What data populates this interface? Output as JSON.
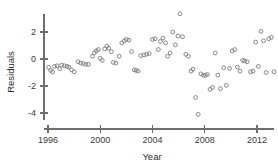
{
  "chart_data": {
    "type": "scatter",
    "title": "",
    "xlabel": "Year",
    "ylabel": "Residuals",
    "xlim": [
      1995.3,
      2013.6
    ],
    "ylim": [
      -4.8,
      3.6
    ],
    "xticks": [
      1996,
      2000,
      2004,
      2008,
      2012
    ],
    "xtick_labels": [
      "1996",
      "2000",
      "2004",
      "2008",
      "2012"
    ],
    "yticks": [
      2,
      0,
      -2,
      -4
    ],
    "ytick_labels": [
      "2",
      "0",
      "-2",
      "-4"
    ],
    "grid": false,
    "legend": null,
    "marker": "open-circle",
    "marker_color": "#7a7a7a",
    "axis_color": "#6e6e6e",
    "points": [
      {
        "x": 1996.05,
        "y": -0.62
      },
      {
        "x": 1996.2,
        "y": -0.85
      },
      {
        "x": 1996.35,
        "y": -0.95
      },
      {
        "x": 1996.5,
        "y": -0.55
      },
      {
        "x": 1996.7,
        "y": -0.5
      },
      {
        "x": 1996.9,
        "y": -0.72
      },
      {
        "x": 1997.05,
        "y": -0.45
      },
      {
        "x": 1997.25,
        "y": -0.5
      },
      {
        "x": 1997.45,
        "y": -0.55
      },
      {
        "x": 1997.6,
        "y": -0.6
      },
      {
        "x": 1997.8,
        "y": -0.8
      },
      {
        "x": 1998.0,
        "y": -0.95
      },
      {
        "x": 1998.3,
        "y": -0.2
      },
      {
        "x": 1998.5,
        "y": -0.3
      },
      {
        "x": 1998.7,
        "y": -0.35
      },
      {
        "x": 1998.9,
        "y": -0.4
      },
      {
        "x": 1999.1,
        "y": -0.4
      },
      {
        "x": 1999.4,
        "y": 0.2
      },
      {
        "x": 1999.55,
        "y": 0.45
      },
      {
        "x": 1999.7,
        "y": 0.6
      },
      {
        "x": 1999.85,
        "y": 0.7
      },
      {
        "x": 2000.0,
        "y": 0.05
      },
      {
        "x": 2000.15,
        "y": -0.1
      },
      {
        "x": 2000.35,
        "y": 0.75
      },
      {
        "x": 2000.5,
        "y": 0.95
      },
      {
        "x": 2000.65,
        "y": 0.8
      },
      {
        "x": 2000.85,
        "y": 0.55
      },
      {
        "x": 2001.0,
        "y": -0.25
      },
      {
        "x": 2001.2,
        "y": -0.3
      },
      {
        "x": 2001.45,
        "y": 0.2
      },
      {
        "x": 2001.65,
        "y": 1.2
      },
      {
        "x": 2001.85,
        "y": 1.35
      },
      {
        "x": 2002.0,
        "y": 1.45
      },
      {
        "x": 2002.2,
        "y": 1.4
      },
      {
        "x": 2002.4,
        "y": 0.55
      },
      {
        "x": 2002.6,
        "y": -0.8
      },
      {
        "x": 2002.75,
        "y": -0.85
      },
      {
        "x": 2002.9,
        "y": -0.9
      },
      {
        "x": 2003.1,
        "y": 0.25
      },
      {
        "x": 2003.35,
        "y": 0.3
      },
      {
        "x": 2003.55,
        "y": 0.35
      },
      {
        "x": 2003.75,
        "y": 0.4
      },
      {
        "x": 2004.0,
        "y": 1.45
      },
      {
        "x": 2004.2,
        "y": 1.5
      },
      {
        "x": 2004.45,
        "y": 0.7
      },
      {
        "x": 2004.6,
        "y": 1.3
      },
      {
        "x": 2004.8,
        "y": 1.55
      },
      {
        "x": 2005.0,
        "y": 1.2
      },
      {
        "x": 2005.15,
        "y": 0.2
      },
      {
        "x": 2005.35,
        "y": 0.45
      },
      {
        "x": 2005.55,
        "y": 2.0
      },
      {
        "x": 2005.75,
        "y": 1.05
      },
      {
        "x": 2005.95,
        "y": 1.7
      },
      {
        "x": 2006.1,
        "y": 3.35
      },
      {
        "x": 2006.3,
        "y": 1.65
      },
      {
        "x": 2006.55,
        "y": 0.35
      },
      {
        "x": 2006.75,
        "y": 0.2
      },
      {
        "x": 2006.95,
        "y": -0.9
      },
      {
        "x": 2007.1,
        "y": -0.75
      },
      {
        "x": 2007.3,
        "y": -2.85
      },
      {
        "x": 2007.5,
        "y": -4.1
      },
      {
        "x": 2007.7,
        "y": -1.1
      },
      {
        "x": 2007.9,
        "y": -1.2
      },
      {
        "x": 2008.05,
        "y": -1.2
      },
      {
        "x": 2008.2,
        "y": -1.15
      },
      {
        "x": 2008.4,
        "y": -2.25
      },
      {
        "x": 2008.6,
        "y": -2.1
      },
      {
        "x": 2008.8,
        "y": 0.45
      },
      {
        "x": 2009.0,
        "y": -1.2
      },
      {
        "x": 2009.2,
        "y": -2.2
      },
      {
        "x": 2009.45,
        "y": -0.65
      },
      {
        "x": 2009.65,
        "y": -1.95
      },
      {
        "x": 2009.9,
        "y": -0.7
      },
      {
        "x": 2010.1,
        "y": 0.6
      },
      {
        "x": 2010.3,
        "y": 0.7
      },
      {
        "x": 2010.5,
        "y": -0.6
      },
      {
        "x": 2010.7,
        "y": -0.9
      },
      {
        "x": 2010.9,
        "y": -0.1
      },
      {
        "x": 2011.05,
        "y": -0.15
      },
      {
        "x": 2011.25,
        "y": -0.2
      },
      {
        "x": 2011.5,
        "y": -0.95
      },
      {
        "x": 2011.7,
        "y": -0.9
      },
      {
        "x": 2011.9,
        "y": 1.25
      },
      {
        "x": 2012.1,
        "y": -0.55
      },
      {
        "x": 2012.3,
        "y": 2.05
      },
      {
        "x": 2012.5,
        "y": 1.35
      },
      {
        "x": 2012.7,
        "y": -1.0
      },
      {
        "x": 2012.9,
        "y": 1.5
      },
      {
        "x": 2013.1,
        "y": 1.6
      },
      {
        "x": 2013.3,
        "y": -0.95
      }
    ]
  }
}
